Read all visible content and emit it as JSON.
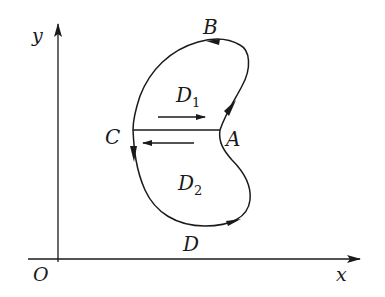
{
  "diagram": {
    "type": "closed-curve-region-split",
    "axes": {
      "x_label": "x",
      "y_label": "y",
      "origin_label": "O"
    },
    "points": {
      "A": "A",
      "B": "B",
      "C": "C",
      "D": "D"
    },
    "regions": {
      "D1": {
        "letter": "D",
        "subscript": "1"
      },
      "D2": {
        "letter": "D",
        "subscript": "2"
      }
    },
    "arrows": {
      "upper_segment_direction": "right",
      "lower_segment_direction": "left",
      "curve_orientation": "counterclockwise"
    },
    "colors": {
      "stroke": "#1a1a1a",
      "background": "#ffffff"
    }
  }
}
